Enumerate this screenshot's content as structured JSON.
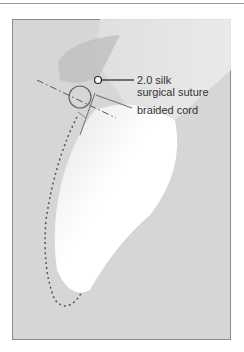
{
  "figure": {
    "labels": {
      "suture_line1": "2.0 silk",
      "suture_line2": "surgical suture",
      "cord": "braided cord"
    },
    "colors": {
      "background": "#d6d6d6",
      "border": "#8a8a8a",
      "line": "#555555",
      "text": "#333333"
    }
  }
}
